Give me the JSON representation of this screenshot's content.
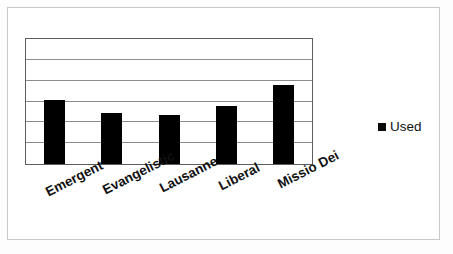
{
  "chart_data": {
    "type": "bar",
    "title": "",
    "subtitle": "",
    "xlabel": "",
    "ylabel": "",
    "categories": [
      "Emergent",
      "Evangelistic",
      "Lausanne",
      "Liberal",
      "Missio Dei"
    ],
    "series": [
      {
        "name": "Used",
        "color": "#000000",
        "values": [
          3.07,
          2.45,
          2.36,
          2.78,
          3.77
        ]
      }
    ],
    "values": [
      3.07,
      2.45,
      2.36,
      2.78,
      3.77
    ],
    "ylim": [
      0,
      6
    ],
    "y_tick_values": [
      0,
      1,
      2,
      3,
      4,
      5,
      6
    ],
    "y_tick_labels": [],
    "x_tick_labels": [
      "Emergent",
      "Evangelistic",
      "Lausanne",
      "Liberal",
      "Missio Dei"
    ],
    "grid": true,
    "grid_orientation": "horizontal",
    "grid_color": "#8c8c8c",
    "legend": {
      "position": "right",
      "entries": [
        {
          "label": "Used",
          "marker": "square",
          "color": "#000000"
        }
      ]
    },
    "axis_label_rotation": -27,
    "plot_border_color": "#5d5d5d",
    "background_color": "#ffffff"
  },
  "legend": {
    "label": "Used",
    "swatch_name": "legend-swatch-used"
  },
  "frame": {
    "outer_border_color": "#c9c9c9"
  }
}
